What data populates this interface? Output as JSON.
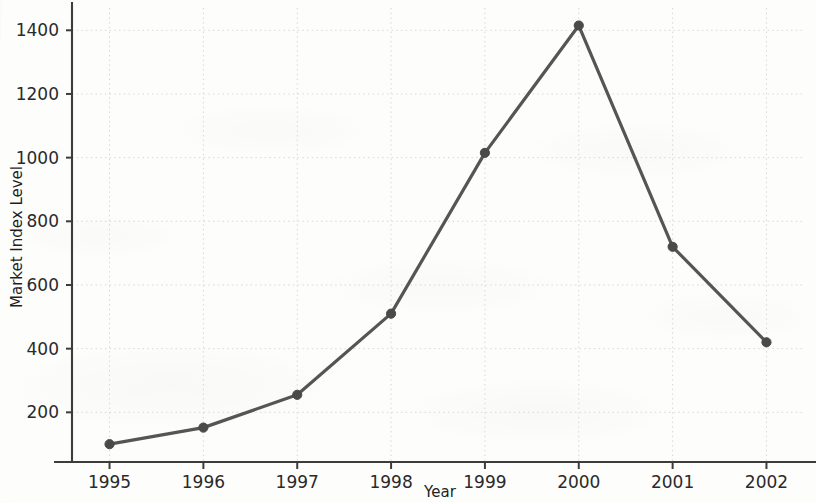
{
  "chart_data": {
    "type": "line",
    "title": "",
    "xlabel": "Year",
    "ylabel": "Market Index Level",
    "categories": [
      "1995",
      "1996",
      "1997",
      "1998",
      "1999",
      "2000",
      "2001",
      "2002"
    ],
    "x": [
      1995,
      1996,
      1997,
      1998,
      1999,
      2000,
      2001,
      2002
    ],
    "values": [
      100,
      152,
      255,
      510,
      1015,
      1415,
      720,
      420
    ],
    "series": [
      {
        "name": "Market Index Level",
        "values": [
          100,
          152,
          255,
          510,
          1015,
          1415,
          720,
          420
        ]
      }
    ],
    "xlim": [
      1994.6,
      2002.4
    ],
    "ylim": [
      44,
      1470
    ],
    "ytick_labels": [
      "200",
      "400",
      "600",
      "800",
      "1000",
      "1200",
      "1400"
    ],
    "yticks": [
      200,
      400,
      600,
      800,
      1000,
      1200,
      1400
    ],
    "xtick_labels": [
      "1995",
      "1996",
      "1997",
      "1998",
      "1999",
      "2000",
      "2001",
      "2002"
    ],
    "grid": true,
    "grid_style": "dotted",
    "legend": "none",
    "line_color": "#555555",
    "marker": "circle",
    "marker_color": "#4a4a4a",
    "background_color": "#fdfdfc",
    "grid_color": "#d8d8d4",
    "axis_color": "#3c3c3c"
  },
  "axis": {
    "y_title": "Market Index Level",
    "x_title": "Year"
  }
}
